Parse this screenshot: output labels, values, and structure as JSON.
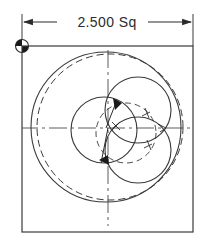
{
  "drawing": {
    "type": "engineering-drawing",
    "title": "Square plate with concentric and trilobed circle pattern",
    "background_color": "#ffffff",
    "line_color": "#3a3a3a",
    "text_color": "#2b2b2b",
    "dimension": {
      "label": "2.500 Sq",
      "value": "2.500",
      "suffix": "Sq",
      "arrow_left": "left-arrowhead",
      "arrow_right": "right-arrowhead"
    },
    "datum": {
      "name": "datum-target-symbol",
      "style": "half-filled-circle"
    },
    "frame": {
      "name": "square-part-outline",
      "x": 22,
      "y": 46,
      "width": 171,
      "height": 186
    },
    "center": {
      "x": 108,
      "y": 128
    },
    "centerlines": {
      "horizontal": {
        "y": 128,
        "x1": 20,
        "x2": 196
      },
      "vertical": {
        "x": 108,
        "y1": 50,
        "y2": 226
      },
      "style": "dash-dot"
    },
    "circles": [
      {
        "name": "outer-solid-circle",
        "cx": 106,
        "cy": 127,
        "r": 75,
        "style": "solid"
      },
      {
        "name": "outer-dashed-circle",
        "cx": 110,
        "cy": 127,
        "r": 73,
        "style": "dashed"
      },
      {
        "name": "left-lobe-circle",
        "cx": 104,
        "cy": 130,
        "r": 33,
        "style": "solid"
      },
      {
        "name": "upper-right-lobe-circle",
        "cx": 138,
        "cy": 110,
        "r": 33,
        "style": "solid"
      },
      {
        "name": "lower-right-lobe-circle",
        "cx": 138,
        "cy": 150,
        "r": 33,
        "style": "solid"
      },
      {
        "name": "inner-dashed-lobe-arc",
        "cx": 126,
        "cy": 133,
        "r": 30,
        "style": "dashed"
      }
    ],
    "arrows": [
      {
        "name": "upper-left-leader-arrow",
        "x": 112,
        "y": 108,
        "angle": -115
      },
      {
        "name": "lower-left-leader-arrow",
        "x": 105,
        "y": 152,
        "angle": 65
      },
      {
        "name": "upper-right-tick-arrow",
        "x": 146,
        "y": 112,
        "angle": 10
      },
      {
        "name": "lower-right-tick-arrow",
        "x": 150,
        "y": 146,
        "angle": -20
      },
      {
        "name": "center-tick-arrow",
        "x": 118,
        "y": 126,
        "angle": 150
      }
    ]
  }
}
